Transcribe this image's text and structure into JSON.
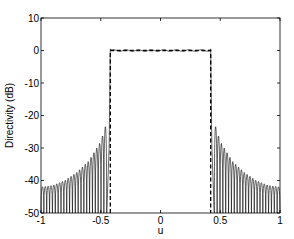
{
  "chart_data": {
    "type": "line",
    "title": "",
    "xlabel": "u",
    "ylabel": "Directivity (dB)",
    "xlim": [
      -1,
      1
    ],
    "ylim": [
      -50,
      10
    ],
    "xticks": [
      -1,
      -0.5,
      0,
      0.5,
      1
    ],
    "xtick_labels": [
      "-1",
      "-0.5",
      "0",
      "0.5",
      "1"
    ],
    "yticks": [
      10,
      0,
      -10,
      -20,
      -30,
      -40,
      -50
    ],
    "ytick_labels": [
      "10",
      "0",
      "-10",
      "-20",
      "-30",
      "-40",
      "-50"
    ],
    "grid": false,
    "legend": null,
    "series": [
      {
        "name": "synthesized pattern",
        "style": "solid",
        "color": "#000000",
        "mainlobe": {
          "u_start": -0.43,
          "u_end": 0.43,
          "level_db": 0,
          "ripple_db": 0.5
        },
        "sidelobes": {
          "u_inner": 0.45,
          "u_outer": 1.0,
          "count_per_side": 23,
          "floor_db": -50,
          "envelope": [
            {
              "u": 0.45,
              "peak_db": -22
            },
            {
              "u": 0.5,
              "peak_db": -28
            },
            {
              "u": 0.6,
              "peak_db": -34
            },
            {
              "u": 0.7,
              "peak_db": -37.5
            },
            {
              "u": 0.8,
              "peak_db": -40
            },
            {
              "u": 0.9,
              "peak_db": -41.5
            },
            {
              "u": 1.0,
              "peak_db": -42
            }
          ]
        }
      },
      {
        "name": "desired pattern",
        "style": "dashed",
        "color": "#000000",
        "points": [
          {
            "u": -0.42,
            "db": -50
          },
          {
            "u": -0.42,
            "db": 0
          },
          {
            "u": 0.42,
            "db": 0
          },
          {
            "u": 0.42,
            "db": -50
          }
        ]
      }
    ]
  }
}
